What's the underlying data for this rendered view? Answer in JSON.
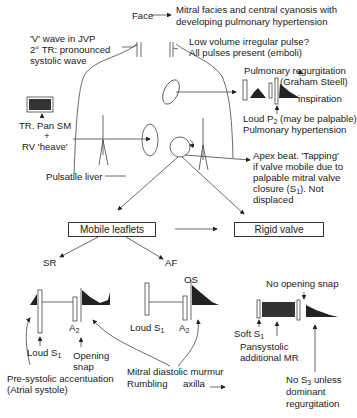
{
  "diagram": {
    "topic": "Clinical signs of mitral stenosis",
    "labels": {
      "face": "Face",
      "face_desc_1": "Mitral facies and central cyanosis with",
      "face_desc_2": "developing pulmonary hypertension",
      "jvp_1": "'V' wave in JVP",
      "jvp_2": "2° TR: pronounced",
      "jvp_3": "systolic wave",
      "pulse_1": "Low volume irregular pulse?",
      "pulse_2": "All pulses present (emboli)",
      "pr_1": "Pulmonary regurgitation",
      "pr_2": "(Graham Steell)",
      "inspiration": "inspiration",
      "p2_1": "Loud P",
      "p2_sub": "2",
      "p2_2": " (may be palpable)",
      "pht": "Pulmonary hypertension",
      "tr_1": "TR. Pan SM",
      "tr_plus": "+",
      "tr_2": "RV 'heave'",
      "liver": "Pulsatile liver",
      "apex_1": "Apex beat. 'Tapping'",
      "apex_2": "if valve mobile due to",
      "apex_3": "palpable mitral valve",
      "apex_4a": "closure (S",
      "apex_4sub": "1",
      "apex_4b": "). Not",
      "apex_5": "displaced",
      "sr": "SR",
      "af": "AF",
      "a2_left": "A",
      "a2_left_sub": "2",
      "loud_s1_left": "Loud S",
      "loud_s1_left_sub": "1",
      "opening_snap_1": "Opening",
      "opening_snap_2": "snap",
      "presystolic_1": "Pre-systolic accentuation",
      "presystolic_2": "(Atrial systole)",
      "loud_s1_mid": "Loud S",
      "loud_s1_mid_sub": "1",
      "os": "OS",
      "a2_mid": "A",
      "a2_mid_sub": "2",
      "mdm_1": "Mitral diastolic murmur",
      "mdm_2a": "Rumbling",
      "mdm_2b": "axilla",
      "no_os": "No opening snap",
      "soft_s1": "Soft S",
      "soft_s1_sub": "1",
      "pansys_1": "Pansystolic",
      "pansys_2": "additional MR",
      "nos3_1": "No S",
      "nos3_sub": "3",
      "nos3_1b": " unless",
      "nos3_2": "dominant",
      "nos3_3": "regurgitation"
    },
    "boxes": {
      "mobile": "Mobile leaflets",
      "rigid": "Rigid valve"
    },
    "colors": {
      "ink": "#1a1a1a",
      "line": "#444444",
      "background": "#ffffff"
    }
  }
}
